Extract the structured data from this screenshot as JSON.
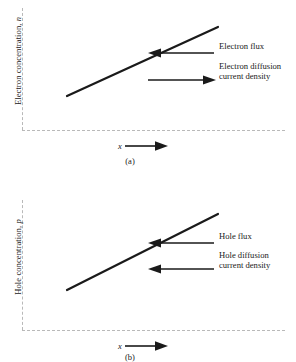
{
  "figure": {
    "type": "diagram",
    "line_color": "#1a1a1a",
    "axis_color": "#b9b9b9"
  },
  "panels": [
    {
      "id": "a",
      "caption": "(a)",
      "carrier": "electron",
      "y_axis": {
        "label_text": "Electron concentration, ",
        "label_symbol": "n"
      },
      "x_axis": {
        "label_symbol": "x",
        "arrow_direction": "right"
      },
      "concentration_line": {
        "shape": "linear-increasing",
        "x1": 67,
        "y1": 96,
        "x2": 218,
        "y2": 27,
        "width": 2.2
      },
      "annotations": [
        {
          "name": "electron-flux",
          "label": "Electron flux",
          "arrow_direction": "left",
          "arrow_x": 148,
          "arrow_y": 46,
          "arrow_length": 66,
          "text_x": 219,
          "text_y": 41
        },
        {
          "name": "electron-diffusion-current-density",
          "label_line1": "Electron diffusion",
          "label_line2": "current density",
          "arrow_direction": "right",
          "arrow_x": 148,
          "arrow_y": 73,
          "arrow_length": 66,
          "text_x": 219,
          "text_y": 61
        }
      ]
    },
    {
      "id": "b",
      "caption": "(b)",
      "carrier": "hole",
      "y_axis": {
        "label_text": "Hole concentration, ",
        "label_symbol": "p"
      },
      "x_axis": {
        "label_symbol": "x",
        "arrow_direction": "right"
      },
      "concentration_line": {
        "shape": "linear-increasing",
        "x1": 67,
        "y1": 110,
        "x2": 218,
        "y2": 34,
        "width": 2.2
      },
      "annotations": [
        {
          "name": "hole-flux",
          "label": "Hole flux",
          "arrow_direction": "left",
          "arrow_x": 148,
          "arrow_y": 56,
          "arrow_length": 66,
          "text_x": 219,
          "text_y": 51
        },
        {
          "name": "hole-diffusion-current-density",
          "label_line1": "Hole diffusion",
          "label_line2": "current density",
          "arrow_direction": "left",
          "arrow_x": 148,
          "arrow_y": 82,
          "arrow_length": 66,
          "text_x": 219,
          "text_y": 70
        }
      ]
    }
  ]
}
